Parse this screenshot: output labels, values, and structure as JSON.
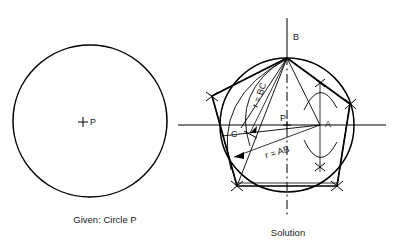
{
  "figure": {
    "title_left": "Given: Circle P",
    "title_right": "Solution",
    "topic": "Constructing a regular pentagon inscribed in a circle"
  },
  "left_panel": {
    "caption": "Given: Circle P",
    "center_label": "P",
    "center_marker": "plus-mark",
    "circle": {
      "cx": 90,
      "cy": 122,
      "r": 77,
      "stroke": "#000000"
    }
  },
  "right_panel": {
    "caption": "Solution",
    "circle": {
      "cx": 287,
      "cy": 125,
      "r": 67,
      "stroke": "#000000"
    },
    "labels": [
      {
        "id": "point-b",
        "text": "B",
        "x": 293,
        "y": 36
      },
      {
        "id": "point-p",
        "text": "P",
        "x": 280,
        "y": 121
      },
      {
        "id": "point-a",
        "text": "A",
        "x": 327,
        "y": 127
      },
      {
        "id": "point-c",
        "text": "C",
        "x": 232,
        "y": 136
      }
    ],
    "radius_annotations": [
      {
        "id": "r-bc",
        "text": "r = BC",
        "x": 258,
        "y": 92,
        "rotation": -72
      },
      {
        "id": "r-ab",
        "text": "r = AB",
        "x": 277,
        "y": 154,
        "rotation": -14
      }
    ],
    "pentagon_vertices": [
      {
        "id": "B",
        "x": 287,
        "y": 58
      },
      {
        "id": "upper-right",
        "x": 350,
        "y": 104
      },
      {
        "id": "lower-right",
        "x": 337,
        "y": 186
      },
      {
        "id": "lower-left",
        "x": 237,
        "y": 186
      },
      {
        "id": "upper-left",
        "x": 212,
        "y": 96
      }
    ],
    "axes": {
      "vertical_label": "vertical-center-line",
      "horizontal_label": "horizontal-center-line"
    }
  },
  "colors": {
    "ink": "#000000",
    "text": "#1a1a1a",
    "background": "#ffffff"
  }
}
